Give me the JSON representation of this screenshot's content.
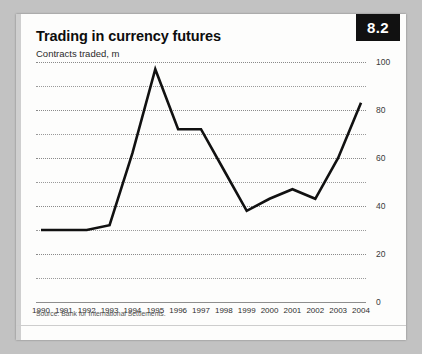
{
  "card": {
    "badge": "8.2",
    "title": "Trading in currency futures",
    "subtitle": "Contracts traded, m",
    "source": "Source: Bank for International Settlements."
  },
  "chart_data": {
    "type": "line",
    "title": "Trading in currency futures",
    "subtitle": "Contracts traded, m",
    "xlabel": "",
    "ylabel": "Contracts traded, m",
    "ylim": [
      0,
      100
    ],
    "yticks": [
      0,
      20,
      40,
      60,
      80,
      100
    ],
    "ytick_labels": [
      "0",
      "20",
      "40",
      "60",
      "80",
      "100"
    ],
    "gridlines_minor": [
      10,
      30,
      50,
      70,
      90
    ],
    "grid": true,
    "legend": "none",
    "line_color": "#111111",
    "categories": [
      "1990",
      "1991",
      "1992",
      "1993",
      "1994",
      "1995",
      "1996",
      "1997",
      "1998",
      "1999",
      "2000",
      "2001",
      "2002",
      "2003",
      "2004"
    ],
    "values": [
      30,
      30,
      30,
      32,
      62,
      97,
      72,
      72,
      55,
      38,
      43,
      47,
      43,
      60,
      83
    ]
  }
}
